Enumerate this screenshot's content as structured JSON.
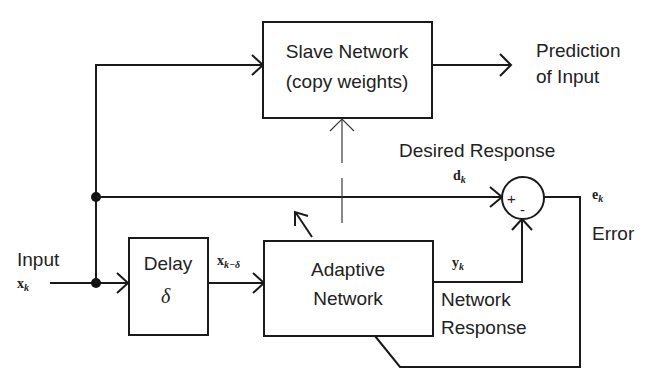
{
  "diagram": {
    "type": "block-diagram",
    "blocks": {
      "slave": {
        "line1": "Slave Network",
        "line2": "(copy weights)"
      },
      "delay": {
        "label": "Delay",
        "symbol": "δ"
      },
      "adaptive": {
        "line1": "Adaptive",
        "line2": "Network"
      }
    },
    "summing_junction": {
      "plus": "+",
      "minus": "-"
    },
    "labels": {
      "input": "Input",
      "input_symbol": "x",
      "input_sub": "k",
      "delayed_symbol": "x",
      "delayed_sub": "k−δ",
      "prediction_line1": "Prediction",
      "prediction_line2": "of Input",
      "desired": "Desired Response",
      "desired_symbol": "d",
      "desired_sub": "k",
      "error_symbol": "e",
      "error_sub": "k",
      "error": "Error",
      "output_symbol": "y",
      "output_sub": "k",
      "network_response_line1": "Network",
      "network_response_line2": "Response"
    }
  }
}
